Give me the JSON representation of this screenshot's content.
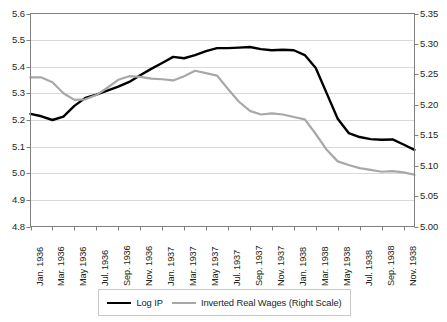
{
  "chart_data": {
    "type": "line",
    "title": "",
    "subtitle": "",
    "xlabel": "",
    "ylabel": "",
    "grid": true,
    "legend_position": "bottom",
    "x": [
      "Jan. 1936",
      "Feb. 1936",
      "Mar. 1936",
      "Apr. 1936",
      "May 1936",
      "Jun. 1936",
      "Jul. 1936",
      "Aug. 1936",
      "Sep. 1936",
      "Oct. 1936",
      "Nov. 1936",
      "Dec. 1936",
      "Jan. 1937",
      "Feb. 1937",
      "Mar. 1937",
      "Apr. 1937",
      "May 1937",
      "Jun. 1937",
      "Jul. 1937",
      "Aug. 1937",
      "Sep. 1937",
      "Oct. 1937",
      "Nov. 1937",
      "Dec. 1937",
      "Jan. 1938",
      "Feb. 1938",
      "Mar. 1938",
      "Apr. 1938",
      "May 1938",
      "Jun. 1938",
      "Jul. 1938",
      "Aug. 1938",
      "Sep. 1938",
      "Oct. 1938",
      "Nov. 1938",
      "Dec. 1938"
    ],
    "xtick_labels": [
      "Jan. 1936",
      "Mar. 1936",
      "May 1936",
      "Jul. 1936",
      "Sep. 1936",
      "Nov. 1936",
      "Jan. 1937",
      "Mar. 1937",
      "May 1937",
      "Jul. 1937",
      "Sep. 1937",
      "Nov. 1937",
      "Jan. 1938",
      "Mar. 1938",
      "May 1938",
      "Jul. 1938",
      "Sep. 1938",
      "Nov. 1938"
    ],
    "xtick_indices": [
      0,
      2,
      4,
      6,
      8,
      10,
      12,
      14,
      16,
      18,
      20,
      22,
      24,
      26,
      28,
      30,
      32,
      34
    ],
    "ylim": [
      4.8,
      5.6
    ],
    "yticks": [
      4.8,
      4.9,
      5.0,
      5.1,
      5.2,
      5.3,
      5.4,
      5.5,
      5.6
    ],
    "ytick_labels": [
      "4.8",
      "4.9",
      "5.0",
      "5.1",
      "5.2",
      "5.3",
      "5.4",
      "5.5",
      "5.6"
    ],
    "y2lim": [
      5.0,
      5.35
    ],
    "y2ticks": [
      5.0,
      5.05,
      5.1,
      5.15,
      5.2,
      5.25,
      5.3,
      5.35
    ],
    "y2tick_labels": [
      "5.00",
      "5.05",
      "5.10",
      "5.15",
      "5.20",
      "5.25",
      "5.30",
      "5.35"
    ],
    "series": [
      {
        "name": "Log IP",
        "axis": "left",
        "color": "#000000",
        "width": 2.4,
        "values": [
          5.223,
          5.214,
          5.2,
          5.213,
          5.253,
          5.283,
          5.295,
          5.31,
          5.325,
          5.343,
          5.368,
          5.392,
          5.414,
          5.437,
          5.432,
          5.444,
          5.459,
          5.47,
          5.47,
          5.472,
          5.474,
          5.466,
          5.462,
          5.464,
          5.462,
          5.444,
          5.395,
          5.3,
          5.205,
          5.151,
          5.136,
          5.128,
          5.126,
          5.127,
          5.108,
          5.088
        ]
      },
      {
        "name": "Inverted Real Wages (Right Scale)",
        "axis": "right",
        "color": "#a8a8a8",
        "width": 2.2,
        "values": [
          5.245,
          5.245,
          5.237,
          5.219,
          5.208,
          5.209,
          5.216,
          5.228,
          5.241,
          5.247,
          5.246,
          5.243,
          5.242,
          5.24,
          5.247,
          5.256,
          5.252,
          5.248,
          5.226,
          5.205,
          5.19,
          5.184,
          5.186,
          5.184,
          5.18,
          5.176,
          5.152,
          5.126,
          5.107,
          5.101,
          5.096,
          5.093,
          5.09,
          5.091,
          5.089,
          5.085
        ]
      }
    ],
    "series_continued": {
      "note": "ip_tail and wage_tail complete the 36-point monthly series through Dec. 1938",
      "Log IP": [
        5.223,
        5.214,
        5.2,
        5.213,
        5.253,
        5.283,
        5.295,
        5.31,
        5.325,
        5.343,
        5.368,
        5.392,
        5.414,
        5.437,
        5.432,
        5.444,
        5.459,
        5.47,
        5.47,
        5.472,
        5.474,
        5.466,
        5.462,
        5.464,
        5.462,
        5.444,
        5.395,
        5.3,
        5.205,
        5.151,
        5.136,
        5.128,
        5.126,
        5.127,
        5.108,
        5.088
      ]
    }
  },
  "legend": {
    "entries": [
      {
        "label": "Log IP",
        "color": "#000000"
      },
      {
        "label": "Inverted Real Wages (Right Scale)",
        "color": "#a8a8a8"
      }
    ]
  },
  "axes": {
    "left_axis_name": "Log IP scale",
    "right_axis_name": "Inverted Real Wages scale"
  },
  "colors": {
    "series_ip": "#000000",
    "series_wages": "#a8a8a8",
    "grid": "#d9d9d9",
    "frame": "#808080",
    "text": "#231f20",
    "background": "#ffffff"
  }
}
